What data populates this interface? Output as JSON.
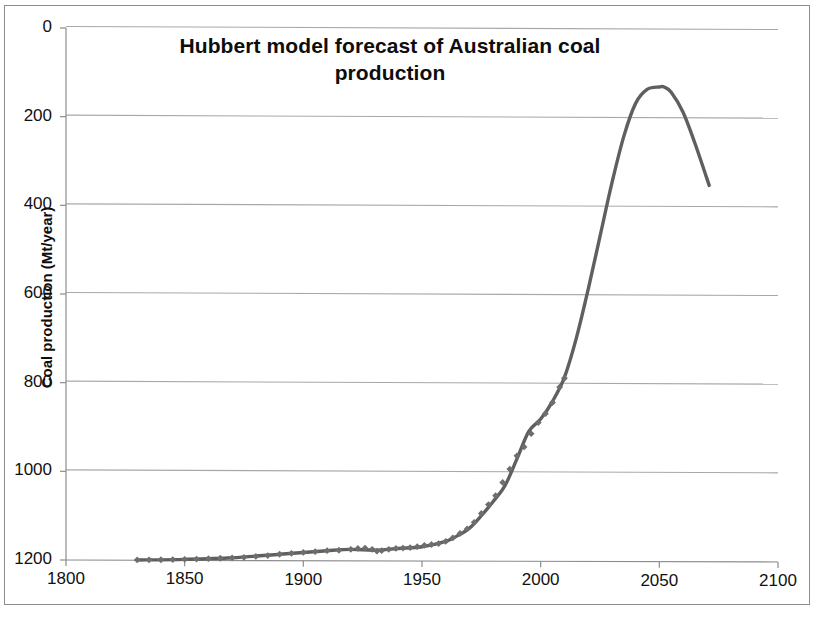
{
  "chart_data": {
    "type": "line",
    "title": "Hubbert model forecast of Australian coal production",
    "title_line1": "Hubbert model forecast of Australian coal",
    "title_line2": "production",
    "xlabel": "",
    "ylabel": "Coal production (Mt/year)",
    "xlim": [
      1800,
      2100
    ],
    "ylim": [
      0,
      1200
    ],
    "xticks": [
      1800,
      1850,
      1900,
      1950,
      2000,
      2050,
      2100
    ],
    "yticks": [
      0,
      200,
      400,
      600,
      800,
      1000,
      1200
    ],
    "grid": "horizontal",
    "legend": "none",
    "curve_color": "#5f5f5f",
    "marker_color": "#6e6e6e",
    "gridline_color": "#a8a8a8",
    "axis_color": "#8d8d8d",
    "series": [
      {
        "name": "Historical production (data points)",
        "style": "markers",
        "marker": "diamond",
        "x": [
          1830,
          1835,
          1840,
          1845,
          1850,
          1855,
          1860,
          1865,
          1870,
          1875,
          1880,
          1885,
          1890,
          1895,
          1900,
          1905,
          1910,
          1915,
          1920,
          1923,
          1926,
          1929,
          1931,
          1933,
          1936,
          1939,
          1942,
          1945,
          1948,
          1951,
          1954,
          1957,
          1960,
          1963,
          1966,
          1969,
          1972,
          1975,
          1978,
          1981,
          1984,
          1987,
          1990,
          1993,
          1996,
          1999,
          2002,
          2005,
          2008,
          2010
        ],
        "y": [
          0.1,
          0.3,
          0.6,
          1,
          1.5,
          2,
          3,
          4,
          5,
          6,
          8,
          10,
          13,
          15,
          17,
          19,
          21,
          22,
          24,
          26,
          27,
          24,
          20,
          21,
          24,
          26,
          27,
          28,
          30,
          33,
          35,
          37,
          42,
          50,
          60,
          70,
          85,
          105,
          125,
          145,
          175,
          205,
          235,
          255,
          285,
          310,
          330,
          355,
          390,
          410
        ]
      },
      {
        "name": "Hubbert model forecast curve",
        "style": "line",
        "x": [
          1830,
          1850,
          1870,
          1890,
          1900,
          1910,
          1920,
          1930,
          1940,
          1950,
          1960,
          1965,
          1970,
          1975,
          1980,
          1985,
          1990,
          1995,
          2000,
          2005,
          2010,
          2015,
          2020,
          2025,
          2030,
          2035,
          2040,
          2045,
          2050,
          2052,
          2055,
          2060,
          2065,
          2071
        ],
        "y": [
          0.1,
          1.5,
          5,
          13,
          17,
          21,
          24,
          22,
          26,
          30,
          42,
          55,
          72,
          100,
          132,
          168,
          228,
          290,
          318,
          358,
          412,
          500,
          610,
          730,
          850,
          955,
          1030,
          1062,
          1067,
          1067,
          1055,
          1010,
          940,
          845
        ]
      }
    ],
    "annotations": {
      "peak_year": 2052,
      "peak_value": 1067,
      "last_data_year": 2010,
      "last_data_value": 410,
      "first_data_year": 1830,
      "curve_end_year": 2071,
      "curve_end_value": 845
    }
  },
  "ytick_labels": [
    "1200",
    "1000",
    "800",
    "600",
    "400",
    "200",
    "0"
  ],
  "xtick_labels": [
    "1800",
    "1850",
    "1900",
    "1950",
    "2000",
    "2050",
    "2100"
  ]
}
